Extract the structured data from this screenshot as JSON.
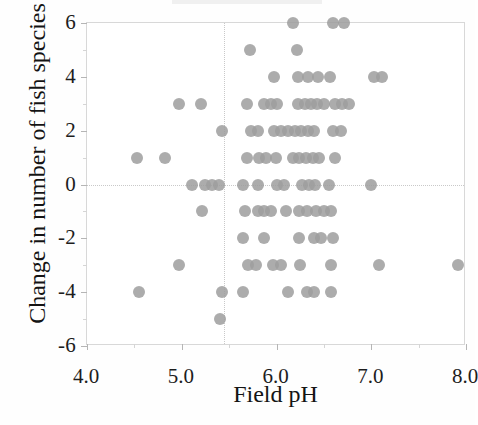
{
  "chart_data": {
    "type": "scatter",
    "title": "",
    "xlabel": "Field pH",
    "ylabel": "Change in number of fish species",
    "xlim": [
      4.0,
      8.0
    ],
    "ylim": [
      -6,
      6
    ],
    "grid": false,
    "legend": null,
    "marker_color": "#9d9d9d",
    "x_ticks": [
      4.0,
      5.0,
      6.0,
      7.0,
      8.0
    ],
    "x_tick_labels": [
      "4.0",
      "5.0",
      "6.0",
      "7.0",
      "8.0"
    ],
    "x_minor_ticks": [
      4.5,
      5.5,
      6.5,
      7.5
    ],
    "y_ticks": [
      6,
      4,
      2,
      0,
      -2,
      -4,
      -6
    ],
    "y_tick_labels": [
      "6",
      "4",
      "2",
      "0",
      "-2",
      "-4",
      "-6"
    ],
    "y_minor_ticks": [
      5,
      3,
      1,
      -1,
      -3,
      -5
    ],
    "reference_lines": [
      {
        "orientation": "vertical",
        "value": 5.45,
        "style": "dotted",
        "color": "#c9c9c9"
      },
      {
        "orientation": "horizontal",
        "value": 0,
        "style": "dotted",
        "color": "#c9c9c9"
      }
    ],
    "points": [
      {
        "x": 6.17,
        "y": 6
      },
      {
        "x": 6.6,
        "y": 6
      },
      {
        "x": 6.71,
        "y": 6
      },
      {
        "x": 5.72,
        "y": 5
      },
      {
        "x": 6.22,
        "y": 5
      },
      {
        "x": 5.97,
        "y": 4
      },
      {
        "x": 6.23,
        "y": 4
      },
      {
        "x": 6.33,
        "y": 4
      },
      {
        "x": 6.44,
        "y": 4
      },
      {
        "x": 6.56,
        "y": 4
      },
      {
        "x": 7.03,
        "y": 4
      },
      {
        "x": 7.11,
        "y": 4
      },
      {
        "x": 4.97,
        "y": 3
      },
      {
        "x": 5.2,
        "y": 3
      },
      {
        "x": 5.69,
        "y": 3
      },
      {
        "x": 5.87,
        "y": 3
      },
      {
        "x": 5.94,
        "y": 3
      },
      {
        "x": 6.01,
        "y": 3
      },
      {
        "x": 6.23,
        "y": 3
      },
      {
        "x": 6.3,
        "y": 3
      },
      {
        "x": 6.36,
        "y": 3
      },
      {
        "x": 6.43,
        "y": 3
      },
      {
        "x": 6.5,
        "y": 3
      },
      {
        "x": 6.62,
        "y": 3
      },
      {
        "x": 6.69,
        "y": 3
      },
      {
        "x": 6.76,
        "y": 3
      },
      {
        "x": 5.42,
        "y": 2
      },
      {
        "x": 5.73,
        "y": 2
      },
      {
        "x": 5.8,
        "y": 2
      },
      {
        "x": 5.97,
        "y": 2
      },
      {
        "x": 6.05,
        "y": 2
      },
      {
        "x": 6.12,
        "y": 2
      },
      {
        "x": 6.19,
        "y": 2
      },
      {
        "x": 6.26,
        "y": 2
      },
      {
        "x": 6.33,
        "y": 2
      },
      {
        "x": 6.4,
        "y": 2
      },
      {
        "x": 6.6,
        "y": 2
      },
      {
        "x": 6.68,
        "y": 2
      },
      {
        "x": 4.53,
        "y": 1
      },
      {
        "x": 4.82,
        "y": 1
      },
      {
        "x": 5.69,
        "y": 1
      },
      {
        "x": 5.82,
        "y": 1
      },
      {
        "x": 5.89,
        "y": 1
      },
      {
        "x": 5.99,
        "y": 1
      },
      {
        "x": 6.17,
        "y": 1
      },
      {
        "x": 6.24,
        "y": 1
      },
      {
        "x": 6.31,
        "y": 1
      },
      {
        "x": 6.38,
        "y": 1
      },
      {
        "x": 6.45,
        "y": 1
      },
      {
        "x": 6.62,
        "y": 1
      },
      {
        "x": 5.11,
        "y": 0
      },
      {
        "x": 5.25,
        "y": 0
      },
      {
        "x": 5.32,
        "y": 0
      },
      {
        "x": 5.39,
        "y": 0
      },
      {
        "x": 5.65,
        "y": 0
      },
      {
        "x": 5.8,
        "y": 0
      },
      {
        "x": 6.01,
        "y": 0
      },
      {
        "x": 6.08,
        "y": 0
      },
      {
        "x": 6.27,
        "y": 0
      },
      {
        "x": 6.34,
        "y": 0
      },
      {
        "x": 6.41,
        "y": 0
      },
      {
        "x": 6.55,
        "y": 0
      },
      {
        "x": 7.0,
        "y": 0
      },
      {
        "x": 5.21,
        "y": -1
      },
      {
        "x": 5.67,
        "y": -1
      },
      {
        "x": 5.8,
        "y": -1
      },
      {
        "x": 5.87,
        "y": -1
      },
      {
        "x": 5.94,
        "y": -1
      },
      {
        "x": 6.1,
        "y": -1
      },
      {
        "x": 6.24,
        "y": -1
      },
      {
        "x": 6.32,
        "y": -1
      },
      {
        "x": 6.42,
        "y": -1
      },
      {
        "x": 6.5,
        "y": -1
      },
      {
        "x": 6.58,
        "y": -1
      },
      {
        "x": 5.65,
        "y": -2
      },
      {
        "x": 5.87,
        "y": -2
      },
      {
        "x": 6.24,
        "y": -2
      },
      {
        "x": 6.4,
        "y": -2
      },
      {
        "x": 6.47,
        "y": -2
      },
      {
        "x": 6.6,
        "y": -2
      },
      {
        "x": 4.97,
        "y": -3
      },
      {
        "x": 5.7,
        "y": -3
      },
      {
        "x": 5.78,
        "y": -3
      },
      {
        "x": 5.96,
        "y": -3
      },
      {
        "x": 6.05,
        "y": -3
      },
      {
        "x": 6.25,
        "y": -3
      },
      {
        "x": 6.58,
        "y": -3
      },
      {
        "x": 7.08,
        "y": -3
      },
      {
        "x": 7.92,
        "y": -3
      },
      {
        "x": 4.55,
        "y": -4
      },
      {
        "x": 5.42,
        "y": -4
      },
      {
        "x": 5.65,
        "y": -4
      },
      {
        "x": 6.12,
        "y": -4
      },
      {
        "x": 6.32,
        "y": -4
      },
      {
        "x": 6.4,
        "y": -4
      },
      {
        "x": 6.57,
        "y": -4
      },
      {
        "x": 5.4,
        "y": -5
      }
    ]
  }
}
